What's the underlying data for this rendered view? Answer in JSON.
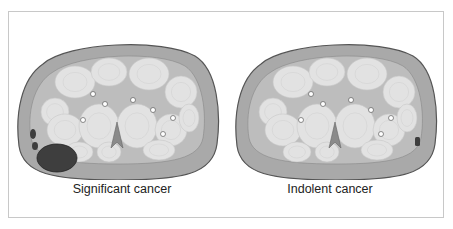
{
  "figure": {
    "panels": [
      {
        "caption": "Significant cancer",
        "lesion": "large dark lesion at posterior-left periphery"
      },
      {
        "caption": "Indolent cancer",
        "lesion": "small dark lesion at right periphery"
      }
    ],
    "colors": {
      "outer_tissue": "#a9a9a9",
      "inner_tissue": "#bdbdbd",
      "nodule": "#e2e2e2",
      "lesion": "#3e3e3e",
      "outline": "#555555",
      "frame_border": "#c8c8c8"
    }
  }
}
